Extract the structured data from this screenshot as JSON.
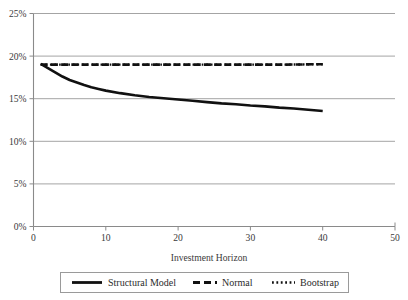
{
  "chart_data": {
    "type": "line",
    "title": "",
    "xlabel": "Investment Horizon",
    "ylabel": "",
    "xlim": [
      0,
      50
    ],
    "ylim": [
      0,
      0.25
    ],
    "grid": true,
    "legend_position": "bottom",
    "x_ticks": [
      "0",
      "10",
      "20",
      "30",
      "40",
      "50"
    ],
    "x_tick_values": [
      0,
      10,
      20,
      30,
      40,
      50
    ],
    "y_ticks": [
      "0%",
      "5%",
      "10%",
      "15%",
      "20%",
      "25%"
    ],
    "y_tick_values": [
      0,
      5,
      10,
      15,
      20,
      25
    ],
    "series": [
      {
        "name": "Structural Model",
        "style": "solid",
        "color": "#111111",
        "x": [
          1,
          2,
          3,
          4,
          5,
          6,
          7,
          8,
          9,
          10,
          12,
          14,
          16,
          18,
          20,
          22,
          24,
          26,
          28,
          30,
          32,
          34,
          36,
          38,
          40
        ],
        "values": [
          19.1,
          18.6,
          18.1,
          17.6,
          17.2,
          16.9,
          16.6,
          16.35,
          16.15,
          15.95,
          15.65,
          15.4,
          15.2,
          15.05,
          14.9,
          14.75,
          14.6,
          14.45,
          14.35,
          14.2,
          14.1,
          13.95,
          13.85,
          13.7,
          13.55
        ]
      },
      {
        "name": "Normal",
        "style": "dashed",
        "color": "#111111",
        "x": [
          1,
          5,
          10,
          15,
          20,
          25,
          30,
          35,
          40
        ],
        "values": [
          19.0,
          19.0,
          19.0,
          19.0,
          19.0,
          19.0,
          19.0,
          19.0,
          19.05
        ]
      },
      {
        "name": "Bootstrap",
        "style": "dotted",
        "color": "#111111",
        "x": [
          1,
          5,
          10,
          15,
          20,
          25,
          30,
          35,
          40
        ],
        "values": [
          19.0,
          19.0,
          19.0,
          19.0,
          19.0,
          19.0,
          19.0,
          19.0,
          19.05
        ]
      }
    ]
  },
  "legend": {
    "items": [
      {
        "label": "Structural Model",
        "style": "solid"
      },
      {
        "label": "Normal",
        "style": "dashed"
      },
      {
        "label": "Bootstrap",
        "style": "dotted"
      }
    ]
  },
  "axes": {
    "x_title": "Investment Horizon"
  }
}
